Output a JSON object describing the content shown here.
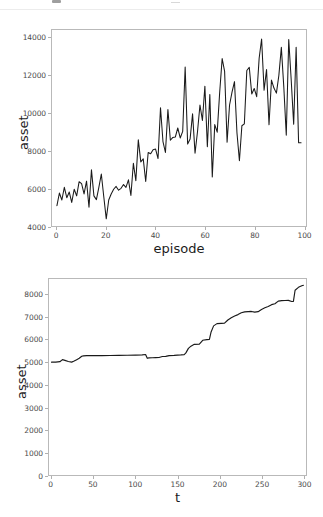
{
  "page": {
    "background": "#ffffff",
    "line_color": "#1a1a1a",
    "axis_color": "#b9b9b9",
    "tick_label_color": "#4b4b4b",
    "axis_title_color": "#1c1c1c"
  },
  "chart_data": [
    {
      "id": "episode-asset-chart",
      "type": "line",
      "title": "",
      "xlabel": "episode",
      "ylabel": "asset",
      "xlim": [
        -2,
        101
      ],
      "ylim": [
        4000,
        14400
      ],
      "xticks": [
        0,
        20,
        40,
        60,
        80,
        100
      ],
      "xticklabels": [
        "0",
        "20",
        "40",
        "60",
        "80",
        "100"
      ],
      "yticks": [
        4000,
        6000,
        8000,
        10000,
        12000,
        14000
      ],
      "yticklabels": [
        "4000",
        "6000",
        "8000",
        "10000",
        "12000",
        "14000"
      ],
      "grid": false,
      "legend": false,
      "series": [
        {
          "name": "asset",
          "color": "#1a1a1a",
          "x": [
            0,
            1,
            2,
            3,
            4,
            5,
            6,
            7,
            8,
            9,
            10,
            11,
            12,
            13,
            14,
            15,
            16,
            17,
            18,
            19,
            20,
            21,
            22,
            23,
            24,
            25,
            26,
            27,
            28,
            29,
            30,
            31,
            32,
            33,
            34,
            35,
            36,
            37,
            38,
            39,
            40,
            41,
            42,
            43,
            44,
            45,
            46,
            47,
            48,
            49,
            50,
            51,
            52,
            53,
            54,
            55,
            56,
            57,
            58,
            59,
            60,
            61,
            62,
            63,
            64,
            65,
            66,
            67,
            68,
            69,
            70,
            71,
            72,
            73,
            74,
            75,
            76,
            77,
            78,
            79,
            80,
            81,
            82,
            83,
            84,
            85,
            86,
            87,
            88,
            89,
            90,
            91,
            92,
            93,
            94,
            95,
            96,
            97,
            98,
            99
          ],
          "values": [
            5080,
            5750,
            5380,
            6050,
            5500,
            5800,
            5250,
            5950,
            5600,
            6350,
            6250,
            5700,
            6380,
            5000,
            6980,
            5600,
            5400,
            6050,
            6760,
            5550,
            4380,
            5380,
            5700,
            5950,
            6100,
            5900,
            6000,
            6200,
            6050,
            6450,
            5620,
            7330,
            6400,
            8570,
            7400,
            7560,
            6360,
            7900,
            7830,
            8050,
            8080,
            7580,
            10270,
            8480,
            7900,
            10180,
            8550,
            8700,
            8720,
            9200,
            8670,
            9020,
            12440,
            8350,
            8620,
            9950,
            7860,
            9000,
            10420,
            9600,
            11420,
            8200,
            10980,
            6600,
            9380,
            8980,
            11100,
            12880,
            12200,
            8450,
            10420,
            11100,
            11660,
            8950,
            7460,
            9320,
            9420,
            12250,
            12420,
            11000,
            11300,
            10860,
            12900,
            13920,
            11200,
            12300,
            9380,
            11740,
            11320,
            11050,
            12000,
            13480,
            11380,
            8820,
            13900,
            11750,
            9400,
            13480,
            8420,
            8420
          ]
        }
      ]
    },
    {
      "id": "t-asset-chart",
      "type": "line",
      "title": "",
      "xlabel": "t",
      "ylabel": "asset",
      "xlim": [
        -3,
        303
      ],
      "ylim": [
        0,
        8700
      ],
      "xticks": [
        0,
        50,
        100,
        150,
        200,
        250,
        300
      ],
      "xticklabels": [
        "0",
        "50",
        "100",
        "150",
        "200",
        "250",
        "300"
      ],
      "yticks": [
        0,
        1000,
        2000,
        3000,
        4000,
        5000,
        6000,
        7000,
        8000
      ],
      "yticklabels": [
        "0",
        "1000",
        "2000",
        "3000",
        "4000",
        "5000",
        "6000",
        "7000",
        "8000"
      ],
      "grid": false,
      "legend": false,
      "series": [
        {
          "name": "asset",
          "color": "#1a1a1a",
          "x": [
            0,
            5,
            10,
            13,
            16,
            20,
            24,
            27,
            30,
            33,
            36,
            38,
            42,
            50,
            60,
            70,
            80,
            90,
            100,
            108,
            112,
            114,
            116,
            120,
            124,
            128,
            132,
            136,
            140,
            146,
            150,
            154,
            158,
            160,
            163,
            166,
            170,
            176,
            180,
            185,
            188,
            190,
            193,
            197,
            202,
            206,
            210,
            214,
            218,
            222,
            226,
            230,
            234,
            238,
            242,
            246,
            250,
            254,
            258,
            262,
            266,
            270,
            274,
            278,
            282,
            286,
            288,
            290,
            294,
            298,
            300
          ],
          "values": [
            5010,
            5010,
            5030,
            5120,
            5090,
            5040,
            5010,
            5060,
            5120,
            5180,
            5270,
            5290,
            5300,
            5300,
            5300,
            5305,
            5310,
            5315,
            5320,
            5330,
            5350,
            5180,
            5200,
            5205,
            5210,
            5215,
            5260,
            5265,
            5300,
            5310,
            5320,
            5330,
            5345,
            5420,
            5620,
            5720,
            5800,
            5810,
            5980,
            6010,
            6020,
            6350,
            6620,
            6720,
            6730,
            6740,
            6880,
            6980,
            7060,
            7120,
            7200,
            7240,
            7250,
            7260,
            7230,
            7250,
            7350,
            7420,
            7480,
            7560,
            7600,
            7720,
            7740,
            7745,
            7750,
            7700,
            7705,
            8200,
            8330,
            8400,
            8420
          ]
        }
      ]
    }
  ]
}
